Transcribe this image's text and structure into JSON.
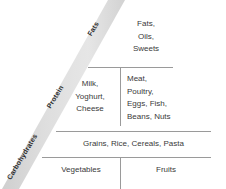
{
  "diagram": {
    "band": {
      "color": "#dcdcdc",
      "labels": [
        {
          "id": "fats",
          "text": "Fats"
        },
        {
          "id": "protein",
          "text": "Protein"
        },
        {
          "id": "carbohydrates",
          "text": "Carbohydrates"
        }
      ]
    },
    "rule_color": "#9a9a9a",
    "text_color": "#3a3a3a",
    "tiers": [
      {
        "id": "tier-fats-oils-sweets",
        "cells": [
          {
            "id": "fats-oils-sweets",
            "lines": [
              "Fats,",
              "Oils,",
              "Sweets"
            ]
          }
        ]
      },
      {
        "id": "tier-dairy-protein",
        "cells": [
          {
            "id": "dairy",
            "lines": [
              "Milk,",
              "Yoghurt,",
              "Cheese"
            ]
          },
          {
            "id": "protein-foods",
            "lines": [
              "Meat,",
              "Poultry,",
              "Eggs, Fish,",
              "Beans, Nuts"
            ]
          }
        ]
      },
      {
        "id": "tier-grains",
        "cells": [
          {
            "id": "grains",
            "lines": [
              "Grains, Rice, Cereals, Pasta"
            ]
          }
        ]
      },
      {
        "id": "tier-produce",
        "cells": [
          {
            "id": "vegetables",
            "lines": [
              "Vegetables"
            ]
          },
          {
            "id": "fruits",
            "lines": [
              "Fruits"
            ]
          }
        ]
      }
    ]
  }
}
